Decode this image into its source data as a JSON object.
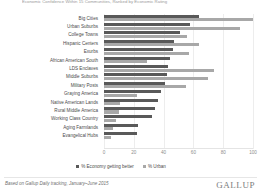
{
  "header": {
    "title": "Economic Confidence Within 15 Communities, Ranked by Economic Rating"
  },
  "footer": {
    "source": "Based on Gallup Daily tracking, January–June 2015",
    "logo": "GALLUP"
  },
  "legend": {
    "items": [
      {
        "label": "% Economy getting better",
        "color": "#595959",
        "key": "economy"
      },
      {
        "label": "% Urban",
        "color": "#a8a8a8",
        "key": "urban"
      }
    ]
  },
  "chart_data": {
    "type": "bar",
    "orientation": "horizontal",
    "grouped": true,
    "title": "Economic Confidence Within 15 Communities, Ranked by Economic Rating",
    "xlabel": "",
    "ylabel": "",
    "xlim": [
      0,
      100
    ],
    "xticks": [
      0,
      20,
      40,
      60,
      80,
      100
    ],
    "grid": true,
    "legend_position": "bottom",
    "categories": [
      "Big Cities",
      "Urban Suburbs",
      "College Towns",
      "Hispanic Centers",
      "Exurbs",
      "African American South",
      "LDS Enclaves",
      "Middle Suburbs",
      "Military Posts",
      "Graying America",
      "Native American Lands",
      "Rural Middle America",
      "Working Class Country",
      "Aging Farmlands",
      "Evangelical Hubs"
    ],
    "series": [
      {
        "name": "% Economy getting better",
        "key": "economy",
        "color": "#595959",
        "values": [
          64,
          58,
          51,
          47,
          46,
          44,
          43,
          42,
          41,
          38,
          36,
          34,
          32,
          23,
          22
        ]
      },
      {
        "name": "% Urban",
        "key": "urban",
        "color": "#a8a8a8",
        "values": [
          100,
          91,
          56,
          64,
          57,
          29,
          74,
          70,
          55,
          22,
          11,
          10,
          8,
          6,
          5
        ]
      }
    ]
  }
}
